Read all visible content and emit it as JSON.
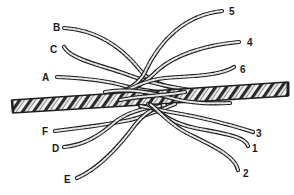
{
  "figure": {
    "background": "#ffffff",
    "ink_color": "#1e1e1e",
    "rope": {
      "left_end": [
        12,
        106
      ],
      "right_end": [
        288,
        89
      ],
      "thickness": 13
    },
    "left_labels": [
      {
        "id": "B",
        "text": "B",
        "x": 53,
        "y": 31
      },
      {
        "id": "C",
        "text": "C",
        "x": 50,
        "y": 53
      },
      {
        "id": "A",
        "text": "A",
        "x": 42,
        "y": 81
      },
      {
        "id": "F",
        "text": "F",
        "x": 42,
        "y": 135
      },
      {
        "id": "D",
        "text": "D",
        "x": 52,
        "y": 152
      },
      {
        "id": "E",
        "text": "E",
        "x": 64,
        "y": 183
      }
    ],
    "right_labels": [
      {
        "id": "5",
        "text": "5",
        "x": 229,
        "y": 15
      },
      {
        "id": "4",
        "text": "4",
        "x": 247,
        "y": 46
      },
      {
        "id": "6",
        "text": "6",
        "x": 240,
        "y": 73
      },
      {
        "id": "3",
        "text": "3",
        "x": 256,
        "y": 137
      },
      {
        "id": "1",
        "text": "1",
        "x": 252,
        "y": 152
      },
      {
        "id": "2",
        "text": "2",
        "x": 243,
        "y": 177
      }
    ]
  }
}
